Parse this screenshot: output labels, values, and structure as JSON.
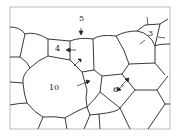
{
  "diagram": {
    "type": "grain-boundary-network",
    "grain_labels": [
      {
        "id": "grain-3",
        "text": "3",
        "x": 148,
        "y": 30
      },
      {
        "id": "grain-4",
        "text": "4",
        "x": 55,
        "y": 44
      },
      {
        "id": "grain-5",
        "text": "5",
        "x": 79,
        "y": 16
      },
      {
        "id": "grain-6",
        "text": "6",
        "x": 113,
        "y": 84
      },
      {
        "id": "grain-10",
        "text": "10",
        "x": 50,
        "y": 83
      }
    ],
    "colors": {
      "line": "#222222",
      "frame": "#999999",
      "background": "#ffffff"
    }
  }
}
